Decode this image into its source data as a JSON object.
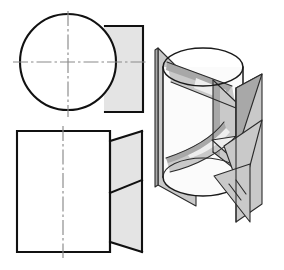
{
  "figure": {
    "kind": "engineering-drawing",
    "canvas": {
      "width": 284,
      "height": 270,
      "background": "#ffffff"
    },
    "palette": {
      "line": "#111111",
      "line_fine": "#2b2b2b",
      "centerline": "#8a8a8a",
      "shade_flat": "#e4e4e4",
      "shade_mid": "#c9c9c9",
      "shade_dark": "#a8a8a8",
      "shade_pale": "#eeeeee",
      "background": "#ffffff"
    }
  },
  "views": {
    "top_view": {
      "name": "top-view",
      "description": "Circle representing the cylinder seen from above with a shaded rectangular cut region on the right",
      "circle": {
        "cx": 68,
        "cy": 62,
        "r": 48
      },
      "shaded_rect": {
        "x": 105,
        "y": 26,
        "width": 38,
        "height": 86
      },
      "centerline_horizontal": {
        "x1": 13,
        "y1": 62,
        "x2": 146,
        "y2": 62
      },
      "centerline_vertical": {
        "x1": 68,
        "y1": 12,
        "x2": 68,
        "y2": 116
      }
    },
    "front_view": {
      "name": "front-view",
      "description": "Rectangular front view of the cylinder with an inclined unfolded flap on the right, split by a diagonal edge",
      "body_rect": {
        "x": 17,
        "y": 131,
        "width": 93,
        "height": 121
      },
      "notch_top": {
        "x": 110,
        "y": 131,
        "step": 10
      },
      "notch_bottom": {
        "x": 110,
        "y": 252,
        "step": 10
      },
      "flap_top_edge": {
        "x1": 110,
        "y1": 141,
        "x2": 142,
        "y2": 131
      },
      "flap_bottom_edge": {
        "x1": 110,
        "y1": 242,
        "x2": 142,
        "y2": 252
      },
      "flap_diagonal": {
        "x1": 110,
        "y1": 193,
        "x2": 142,
        "y2": 180
      },
      "centerline_vertical": {
        "x1": 63,
        "y1": 126,
        "x2": 63,
        "y2": 258
      }
    },
    "pictorial_view": {
      "name": "pictorial-view",
      "description": "Three-dimensional pictorial of the cylinder intersected by two vertical cutting planes forming a wedge",
      "cylinder": {
        "cx": 203,
        "top_cy": 67,
        "bottom_cy": 177,
        "rx": 40,
        "ry": 19
      },
      "left_plane": {
        "top_x": 158,
        "bottom_x": 158
      },
      "right_plane": {
        "top_x": 262,
        "bottom_x": 250
      }
    }
  },
  "elements": {
    "top_view_label": "Top view",
    "front_view_label": "Front view",
    "pictorial_label": "Pictorial view"
  }
}
